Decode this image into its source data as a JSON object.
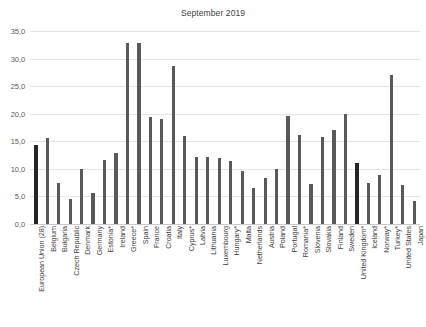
{
  "chart_data": {
    "type": "bar",
    "title": "September 2019",
    "xlabel": "",
    "ylabel": "",
    "ylim": [
      0,
      35
    ],
    "grid": true,
    "legend": false,
    "ytick_labels": [
      "35,0",
      "30,0",
      "25,0",
      "20,0",
      "15,0",
      "10,0",
      "5,0",
      "0,0"
    ],
    "ytick_values": [
      35,
      30,
      25,
      20,
      15,
      10,
      5,
      0
    ],
    "highlight_categories": [
      "European Union (28)",
      "United Kingdom*"
    ],
    "bar_color": "#595959",
    "highlight_color": "#262626",
    "categories": [
      "European Union (28)",
      "Belgium",
      "Bulgaria",
      "Czech Republic",
      "Denmark",
      "Germany",
      "Estonia*",
      "Ireland",
      "Greece*",
      "Spain",
      "France",
      "Croatia",
      "Italy",
      "Cyprus*",
      "Latvia",
      "Lithuania",
      "Luxembourg",
      "Hungary*",
      "Malta",
      "Netherlands",
      "Austria",
      "Poland",
      "Portugal",
      "Romania*",
      "Slovenia",
      "Slovakia",
      "Finland",
      "Sweden",
      "United Kingdom*",
      "Iceland",
      "Norway*",
      "Turkey*",
      "United States",
      "Japan"
    ],
    "values": [
      14.4,
      15.6,
      7.5,
      4.6,
      9.9,
      5.7,
      11.6,
      12.8,
      32.8,
      32.8,
      19.4,
      19.0,
      28.7,
      16.0,
      12.1,
      12.1,
      12.0,
      11.4,
      9.6,
      6.6,
      8.3,
      9.9,
      19.6,
      16.2,
      7.2,
      15.7,
      17.0,
      20.0,
      11.0,
      7.4,
      8.9,
      27.0,
      7.1,
      4.1
    ]
  }
}
